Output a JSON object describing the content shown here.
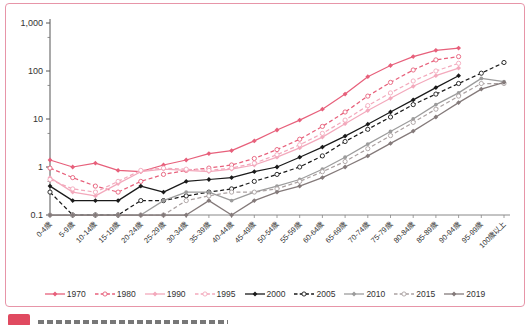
{
  "figure": {
    "border_color": "#e795a8",
    "caption_marker_color": "#e04a60"
  },
  "chart_data": {
    "type": "line",
    "y_scale": "log",
    "ylim": [
      0.1,
      1000
    ],
    "grid": false,
    "legend_position": "bottom",
    "y_ticks": [
      {
        "value": 0.1,
        "label": "0.1"
      },
      {
        "value": 1,
        "label": "1"
      },
      {
        "value": 10,
        "label": "10"
      },
      {
        "value": 100,
        "label": "100"
      },
      {
        "value": 1000,
        "label": "1,000"
      }
    ],
    "categories": [
      "0-4歳",
      "5-9歳",
      "10-14歳",
      "15-19歳",
      "20-24歳",
      "25-29歳",
      "30-34歳",
      "35-39歳",
      "40-44歳",
      "45-49歳",
      "50-54歳",
      "55-59歳",
      "60-64歳",
      "65-69歳",
      "70-74歳",
      "75-79歳",
      "80-84歳",
      "85-89歳",
      "90-94歳",
      "95-99歳",
      "100歳以上"
    ],
    "series": [
      {
        "name": "1970",
        "color": "#e7607b",
        "dash": false,
        "marker": "diamond",
        "values": [
          1.4,
          1.0,
          1.2,
          0.85,
          0.8,
          1.1,
          1.4,
          1.9,
          2.2,
          3.5,
          5.9,
          9.5,
          16,
          33,
          76,
          130,
          200,
          270,
          300,
          null,
          null
        ]
      },
      {
        "name": "1980",
        "color": "#e7607b",
        "dash": true,
        "marker": "open",
        "values": [
          0.95,
          0.6,
          0.4,
          0.3,
          0.5,
          0.7,
          0.85,
          0.95,
          1.1,
          1.5,
          2.3,
          3.8,
          7,
          14,
          30,
          58,
          105,
          170,
          200,
          null,
          null
        ]
      },
      {
        "name": "1990",
        "color": "#f3a9bc",
        "dash": false,
        "marker": "diamond",
        "values": [
          0.6,
          0.3,
          0.25,
          0.45,
          0.8,
          0.9,
          0.85,
          0.8,
          0.9,
          1.1,
          1.6,
          2.5,
          4.2,
          8,
          15,
          27,
          48,
          80,
          115,
          null,
          null
        ]
      },
      {
        "name": "1995",
        "color": "#f3a9bc",
        "dash": true,
        "marker": "open",
        "values": [
          0.55,
          0.35,
          0.3,
          0.5,
          0.85,
          0.95,
          0.9,
          0.85,
          0.95,
          1.2,
          1.8,
          2.9,
          5,
          9.5,
          19,
          35,
          62,
          100,
          145,
          null,
          null
        ]
      },
      {
        "name": "2000",
        "color": "#1a1a1a",
        "dash": false,
        "marker": "diamond",
        "values": [
          0.4,
          0.2,
          0.2,
          0.2,
          0.4,
          0.3,
          0.5,
          0.55,
          0.6,
          0.8,
          1.0,
          1.6,
          2.6,
          4.4,
          7.8,
          14,
          25,
          45,
          80,
          null,
          null
        ]
      },
      {
        "name": "2005",
        "color": "#1a1a1a",
        "dash": true,
        "marker": "open",
        "values": [
          0.3,
          0.1,
          0.1,
          0.1,
          0.2,
          0.2,
          0.25,
          0.3,
          0.35,
          0.5,
          0.7,
          1.0,
          1.7,
          3.4,
          6.1,
          11,
          20,
          33,
          55,
          90,
          150
        ]
      },
      {
        "name": "2010",
        "color": "#9c9c9c",
        "dash": false,
        "marker": "filled",
        "values": [
          0.1,
          0.1,
          0.1,
          0.1,
          0.1,
          0.2,
          0.3,
          0.3,
          0.2,
          0.3,
          0.4,
          0.55,
          0.9,
          1.6,
          3.0,
          5.5,
          10,
          20,
          35,
          70,
          60
        ]
      },
      {
        "name": "2015",
        "color": "#aaa1a1",
        "dash": true,
        "marker": "open",
        "values": [
          0.1,
          0.1,
          0.1,
          0.1,
          0.1,
          0.1,
          0.2,
          0.25,
          0.3,
          0.3,
          0.35,
          0.5,
          0.8,
          1.3,
          2.4,
          4.5,
          8.5,
          16,
          30,
          55,
          55
        ]
      },
      {
        "name": "2019",
        "color": "#847a7a",
        "dash": false,
        "marker": "diamond",
        "values": [
          0.1,
          0.1,
          0.1,
          0.1,
          0.1,
          0.1,
          0.1,
          0.2,
          0.1,
          0.2,
          0.3,
          0.4,
          0.6,
          1.0,
          1.7,
          3.1,
          5.6,
          11,
          22,
          42,
          58
        ]
      }
    ]
  }
}
